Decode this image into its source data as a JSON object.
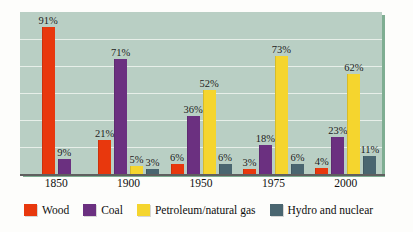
{
  "chart_data": {
    "type": "bar",
    "title": "",
    "subtitle": "",
    "xlabel": "",
    "ylabel": "",
    "ylim": [
      0,
      100
    ],
    "grid": true,
    "gridline_count": 5,
    "legend_position": "bottom",
    "value_suffix": "%",
    "categories": [
      "1850",
      "1900",
      "1950",
      "1975",
      "2000"
    ],
    "series": [
      {
        "name": "Wood",
        "color": "#e8380d",
        "values": [
          91,
          21,
          6,
          3,
          4
        ],
        "labels": [
          "91%",
          "21%",
          "6%",
          "3%",
          "4%"
        ]
      },
      {
        "name": "Coal",
        "color": "#6b3080",
        "values": [
          9,
          71,
          36,
          18,
          23
        ],
        "labels": [
          "9%",
          "71%",
          "36%",
          "18%",
          "23%"
        ]
      },
      {
        "name": "Petroleum/natural gas",
        "color": "#f5d52e",
        "values": [
          0,
          5,
          52,
          73,
          62
        ],
        "labels": [
          "",
          "5%",
          "52%",
          "73%",
          "62%"
        ]
      },
      {
        "name": "Hydro and nuclear",
        "color": "#4a6670",
        "values": [
          0,
          3,
          6,
          6,
          11
        ],
        "labels": [
          "",
          "3%",
          "6%",
          "6%",
          "11%"
        ]
      }
    ]
  },
  "legend": {
    "items": [
      {
        "label": "Wood",
        "color": "#e8380d"
      },
      {
        "label": "Coal",
        "color": "#6b3080"
      },
      {
        "label": "Petroleum/natural gas",
        "color": "#f5d52e"
      },
      {
        "label": "Hydro and nuclear",
        "color": "#4a6670"
      }
    ]
  },
  "colors": {
    "plot_background": "#b9cfc4",
    "plot_edge": "#7fae92",
    "gridline": "#eef4f0",
    "axis": "#5f5f5f",
    "page_background": "#fdfdfb"
  }
}
